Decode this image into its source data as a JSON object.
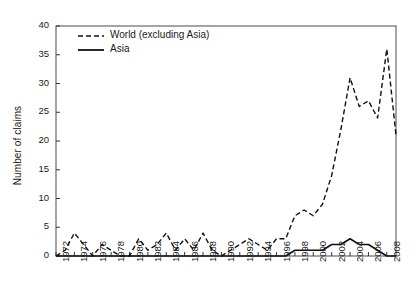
{
  "chart_data": {
    "type": "line",
    "title": "",
    "xlabel": "",
    "ylabel": "Number of claims",
    "xlim": [
      1972,
      2009
    ],
    "ylim": [
      0,
      40
    ],
    "yticks": [
      0,
      5,
      10,
      15,
      20,
      25,
      30,
      35,
      40
    ],
    "xticks": [
      1972,
      1974,
      1976,
      1978,
      1980,
      1982,
      1984,
      1986,
      1988,
      1990,
      1992,
      1994,
      1996,
      1998,
      2000,
      2002,
      2004,
      2006,
      2008
    ],
    "grid": false,
    "legend_position": "upper-left",
    "x": [
      1972,
      1973,
      1974,
      1975,
      1976,
      1977,
      1978,
      1979,
      1980,
      1981,
      1982,
      1983,
      1984,
      1985,
      1986,
      1987,
      1988,
      1989,
      1990,
      1991,
      1992,
      1993,
      1994,
      1995,
      1996,
      1997,
      1998,
      1999,
      2000,
      2001,
      2002,
      2003,
      2004,
      2005,
      2006,
      2007,
      2008,
      2009
    ],
    "series": [
      {
        "name": "World (excluding Asia)",
        "style": "dashed",
        "color": "#111111",
        "values": [
          0,
          1,
          4,
          2,
          0,
          2,
          1,
          0,
          0,
          3,
          1,
          2,
          4,
          1,
          3,
          1,
          4,
          1,
          0,
          1,
          2,
          3,
          2,
          1,
          3,
          3,
          7,
          8,
          7,
          9,
          14,
          22,
          31,
          26,
          27,
          24,
          36,
          21
        ]
      },
      {
        "name": "Asia",
        "style": "solid",
        "color": "#111111",
        "values": [
          0,
          0,
          0,
          0,
          0,
          0,
          0,
          0,
          0,
          0,
          0,
          0,
          0,
          0,
          0,
          0,
          0,
          0,
          0,
          0,
          0,
          0,
          0,
          0,
          0,
          0,
          1,
          1,
          1,
          1,
          2,
          2,
          3,
          2,
          2,
          1,
          0,
          0
        ]
      }
    ]
  },
  "legend": {
    "entries": [
      {
        "label": "World (excluding Asia)",
        "style": "dashed"
      },
      {
        "label": "Asia",
        "style": "solid"
      }
    ]
  }
}
